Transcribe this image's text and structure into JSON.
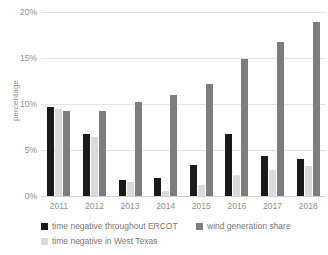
{
  "chart_data": {
    "type": "bar",
    "title": "",
    "subtitle": "",
    "xlabel": "",
    "ylabel": "percentage",
    "categories": [
      "2011",
      "2012",
      "2013",
      "2014",
      "2015",
      "2016",
      "2017",
      "2018"
    ],
    "ylim": [
      0,
      20
    ],
    "yticks": [
      0,
      5,
      10,
      15,
      20
    ],
    "ytick_labels": [
      "0%",
      "5%",
      "10%",
      "15%",
      "20%"
    ],
    "grid": true,
    "legend_position": "bottom-left",
    "units": "percent",
    "series": [
      {
        "name": "time negative throughout ERCOT",
        "color": "#1a1a1a",
        "values": [
          9.7,
          6.7,
          1.7,
          2.0,
          3.4,
          6.7,
          4.3,
          4.0
        ]
      },
      {
        "name": "time negative in West Texas",
        "color": "#dadada",
        "values": [
          9.5,
          6.4,
          1.5,
          0.5,
          1.2,
          2.3,
          2.8,
          3.3
        ]
      },
      {
        "name": "wind generation share",
        "color": "#7d7d7d",
        "values": [
          9.2,
          9.2,
          10.2,
          11.0,
          12.2,
          14.9,
          16.7,
          18.9
        ]
      }
    ],
    "legend_order": [
      {
        "series_index": 0,
        "name": "time negative throughout ERCOT",
        "color": "#1a1a1a"
      },
      {
        "series_index": 2,
        "name": "wind generation share",
        "color": "#7d7d7d"
      },
      {
        "series_index": 1,
        "name": "time negative in West Texas",
        "color": "#dadada"
      }
    ],
    "colors": {
      "series_black": "#1a1a1a",
      "series_light_gray": "#dadada",
      "series_dark_gray": "#7d7d7d",
      "gridline": "#e2e2e2",
      "axis_text": "#8e8e8e",
      "background": "#ffffff"
    }
  }
}
